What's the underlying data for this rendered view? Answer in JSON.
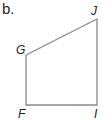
{
  "part_label": "b.",
  "figure": {
    "type": "quadrilateral",
    "stroke_color": "#8a8a8a",
    "vertices": [
      {
        "name": "G",
        "x": 26,
        "y": 55
      },
      {
        "name": "J",
        "x": 97,
        "y": 19
      },
      {
        "name": "I",
        "x": 97,
        "y": 105
      },
      {
        "name": "F",
        "x": 26,
        "y": 105
      }
    ],
    "labels": {
      "G": "G",
      "J": "J",
      "I": "I",
      "F": "F"
    }
  }
}
